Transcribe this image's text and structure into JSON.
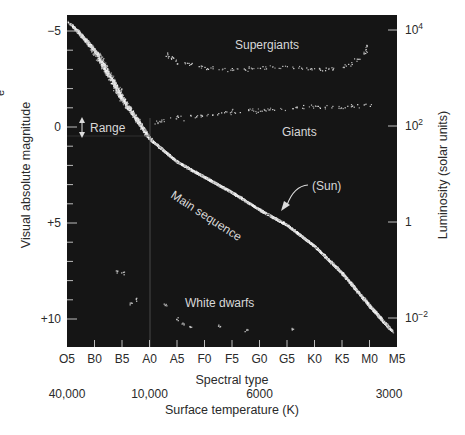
{
  "chart_data": {
    "type": "scatter",
    "title": "",
    "xlabel": "Spectral type",
    "xlabel_secondary": "Surface temperature (K)",
    "ylabel": "Visual absolute magnitude",
    "ylabel_right": "Luminosity (solar units)",
    "colors": {
      "plot_bg": "#151515",
      "stars": "#e6e6e6",
      "text_inside": "#d8d8d8",
      "axis_text": "#2a2a2a"
    },
    "x_spectral_ticks": [
      "O5",
      "B0",
      "B5",
      "A0",
      "A5",
      "F0",
      "F5",
      "G0",
      "G5",
      "K0",
      "K5",
      "M0",
      "M5"
    ],
    "x_temperature_ticks": [
      {
        "label": "40,000",
        "at": "O5"
      },
      {
        "label": "10,000",
        "at": "A0"
      },
      {
        "label": "6000",
        "at": "G0"
      },
      {
        "label": "3000",
        "at": "M5"
      }
    ],
    "y_left_ticks": [
      {
        "label": "−5",
        "value": -5
      },
      {
        "label": "0",
        "value": 0
      },
      {
        "label": "+5",
        "value": 5
      },
      {
        "label": "+10",
        "value": 10
      }
    ],
    "y_left_range": [
      -5.8,
      11.5
    ],
    "y_left_inverted": true,
    "y_right_ticks": [
      {
        "label": "10",
        "sup": "4",
        "value": 10000
      },
      {
        "label": "10",
        "sup": "2",
        "value": 100
      },
      {
        "label": "1",
        "sup": "",
        "value": 1
      },
      {
        "label": "10",
        "sup": "−2",
        "value": 0.01
      }
    ],
    "series": [
      {
        "name": "Main sequence",
        "spine": [
          {
            "x": "O5",
            "xi": 0.2,
            "mag": -5.3
          },
          {
            "x": "B0",
            "xi": 1.0,
            "mag": -4.0
          },
          {
            "x": "B5",
            "xi": 2.0,
            "mag": -1.5
          },
          {
            "x": "A0",
            "xi": 3.0,
            "mag": 0.6
          },
          {
            "x": "A5",
            "xi": 4.0,
            "mag": 1.8
          },
          {
            "x": "F0",
            "xi": 5.0,
            "mag": 2.6
          },
          {
            "x": "F5",
            "xi": 6.0,
            "mag": 3.4
          },
          {
            "x": "G0",
            "xi": 7.0,
            "mag": 4.3
          },
          {
            "x": "G5",
            "xi": 8.0,
            "mag": 5.1
          },
          {
            "x": "K0",
            "xi": 9.0,
            "mag": 6.2
          },
          {
            "x": "K5",
            "xi": 10.0,
            "mag": 7.6
          },
          {
            "x": "M0",
            "xi": 11.0,
            "mag": 9.3
          },
          {
            "x": "M5",
            "xi": 11.8,
            "mag": 10.6
          }
        ]
      },
      {
        "name": "Supergiants",
        "points_xi_mag": [
          [
            3.5,
            -3.9
          ],
          [
            4.0,
            -3.4
          ],
          [
            5,
            -3.1
          ],
          [
            6,
            -3.0
          ],
          [
            7,
            -3.1
          ],
          [
            8,
            -3.2
          ],
          [
            9,
            -3.0
          ],
          [
            10,
            -3.1
          ],
          [
            10.8,
            -3.7
          ],
          [
            10.9,
            -4.4
          ]
        ]
      },
      {
        "name": "Giants",
        "points_xi_mag": [
          [
            3.2,
            -0.2
          ],
          [
            4.0,
            -0.5
          ],
          [
            5,
            -0.6
          ],
          [
            6,
            -0.8
          ],
          [
            7,
            -0.9
          ],
          [
            8,
            -1.0
          ],
          [
            9,
            -1.1
          ],
          [
            10,
            -1.0
          ],
          [
            11,
            -1.2
          ]
        ]
      },
      {
        "name": "White dwarfs",
        "points_xi_mag": [
          [
            1.8,
            7.5
          ],
          [
            2.0,
            7.6
          ],
          [
            2.3,
            9.2
          ],
          [
            2.5,
            9.0
          ],
          [
            3.6,
            9.2
          ],
          [
            4.0,
            10.0
          ],
          [
            4.2,
            10.2
          ],
          [
            4.5,
            10.4
          ],
          [
            5.5,
            10.3
          ],
          [
            6.5,
            10.6
          ],
          [
            8.2,
            10.5
          ]
        ]
      }
    ],
    "annotations": [
      {
        "text": "Supergiants",
        "x": "F5",
        "mag": -3.8
      },
      {
        "text": "Giants",
        "x": "G5",
        "mag": 0.3
      },
      {
        "text": "Main sequence",
        "x": "A5",
        "mag": 3.5,
        "rotation_deg": 33
      },
      {
        "text": "(Sun)",
        "x": "G5",
        "mag": 2.9,
        "arrow_to": {
          "x": "G2",
          "mag": 4.8
        }
      },
      {
        "text": "White dwarfs",
        "x": "F0",
        "mag": 9.6
      },
      {
        "text": "Range",
        "x": "O5",
        "mag": 0,
        "marker": "double-arrow"
      }
    ],
    "grid": false,
    "legend": "none"
  },
  "labels": {
    "supergiants": "Supergiants",
    "giants": "Giants",
    "main_sequence": "Main sequence",
    "sun": "(Sun)",
    "white_dwarfs": "White dwarfs",
    "range": "Range",
    "xlabel": "Spectral type",
    "xlabel2": "Surface temperature (K)",
    "ylabel": "Visual absolute magnitude",
    "ylabel_right": "Luminosity (solar units)",
    "edge_fragment": "e"
  }
}
